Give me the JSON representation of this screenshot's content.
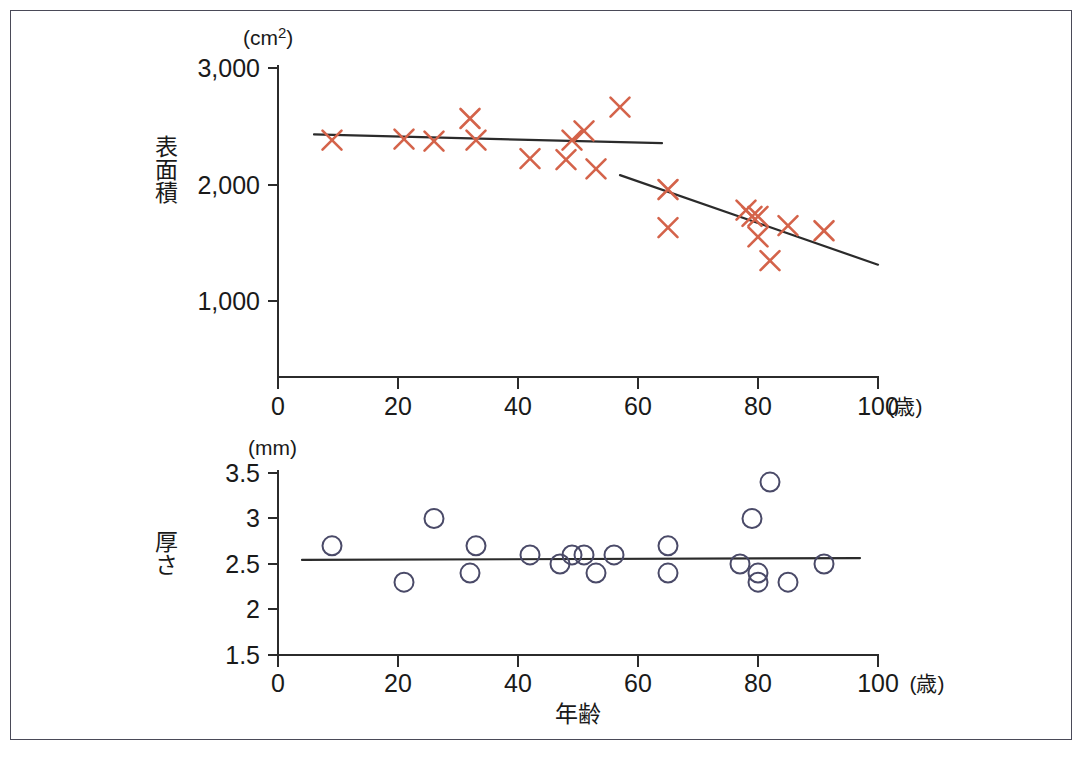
{
  "figure": {
    "frame_border_color": "#4a4a58",
    "background": "#ffffff"
  },
  "chart_data": [
    {
      "type": "scatter",
      "id": "surface-area-vs-age",
      "title": "",
      "xlabel": "年齢",
      "ylabel": "表面積",
      "x_unit": "(歳)",
      "y_unit": "(cm2)",
      "y_unit_display": "cm",
      "y_unit_superscript": "2",
      "xlim": [
        0,
        100
      ],
      "ylim": [
        0,
        3000
      ],
      "xticks": [
        0,
        20,
        40,
        60,
        80,
        100
      ],
      "xticklabels": [
        "0",
        "20",
        "40",
        "60",
        "80",
        "100"
      ],
      "yticks": [
        1000,
        2000,
        3000
      ],
      "yticklabels": [
        "1,000",
        "2,000",
        "3,000"
      ],
      "grid": false,
      "legend": "none",
      "marker": "x",
      "marker_color": "#d4634a",
      "points": [
        {
          "x": 9,
          "y": 2300
        },
        {
          "x": 21,
          "y": 2310
        },
        {
          "x": 26,
          "y": 2290
        },
        {
          "x": 32,
          "y": 2510
        },
        {
          "x": 33,
          "y": 2300
        },
        {
          "x": 42,
          "y": 2120
        },
        {
          "x": 48,
          "y": 2110
        },
        {
          "x": 49,
          "y": 2300
        },
        {
          "x": 51,
          "y": 2390
        },
        {
          "x": 53,
          "y": 2020
        },
        {
          "x": 57,
          "y": 2620
        },
        {
          "x": 65,
          "y": 1820
        },
        {
          "x": 65,
          "y": 1450
        },
        {
          "x": 78,
          "y": 1620
        },
        {
          "x": 79,
          "y": 1560
        },
        {
          "x": 80,
          "y": 1560
        },
        {
          "x": 80,
          "y": 1360
        },
        {
          "x": 82,
          "y": 1130
        },
        {
          "x": 85,
          "y": 1470
        },
        {
          "x": 91,
          "y": 1420
        }
      ],
      "fit_lines": [
        {
          "name": "younger-trend",
          "x_start": 6,
          "y_start": 2355,
          "x_end": 64,
          "y_end": 2270,
          "color": "#2b2b2b"
        },
        {
          "name": "older-trend",
          "x_start": 57,
          "y_start": 1960,
          "x_end": 100,
          "y_end": 1090,
          "color": "#2b2b2b"
        }
      ]
    },
    {
      "type": "scatter",
      "id": "thickness-vs-age",
      "title": "",
      "xlabel": "年齢",
      "ylabel": "厚さ",
      "x_unit": "(歳)",
      "y_unit": "(mm)",
      "xlim": [
        0,
        100
      ],
      "ylim": [
        1.5,
        3.5
      ],
      "xticks": [
        0,
        20,
        40,
        60,
        80,
        100
      ],
      "xticklabels": [
        "0",
        "20",
        "40",
        "60",
        "80",
        "100"
      ],
      "yticks": [
        1.5,
        2,
        2.5,
        3,
        3.5
      ],
      "yticklabels": [
        "1.5",
        "2",
        "2.5",
        "3",
        "3.5"
      ],
      "grid": false,
      "legend": "none",
      "marker": "o",
      "marker_color": "#4a4a68",
      "points": [
        {
          "x": 9,
          "y": 2.7
        },
        {
          "x": 21,
          "y": 2.3
        },
        {
          "x": 26,
          "y": 3.0
        },
        {
          "x": 32,
          "y": 2.4
        },
        {
          "x": 33,
          "y": 2.7
        },
        {
          "x": 42,
          "y": 2.6
        },
        {
          "x": 47,
          "y": 2.5
        },
        {
          "x": 49,
          "y": 2.6
        },
        {
          "x": 51,
          "y": 2.6
        },
        {
          "x": 53,
          "y": 2.4
        },
        {
          "x": 56,
          "y": 2.6
        },
        {
          "x": 65,
          "y": 2.7
        },
        {
          "x": 65,
          "y": 2.4
        },
        {
          "x": 77,
          "y": 2.5
        },
        {
          "x": 79,
          "y": 3.0
        },
        {
          "x": 80,
          "y": 2.4
        },
        {
          "x": 80,
          "y": 2.3
        },
        {
          "x": 82,
          "y": 3.4
        },
        {
          "x": 85,
          "y": 2.3
        },
        {
          "x": 91,
          "y": 2.5
        }
      ],
      "fit_lines": [
        {
          "name": "thickness-trend",
          "x_start": 4,
          "y_start": 2.545,
          "x_end": 97,
          "y_end": 2.565,
          "color": "#2b2b2b"
        }
      ]
    }
  ]
}
